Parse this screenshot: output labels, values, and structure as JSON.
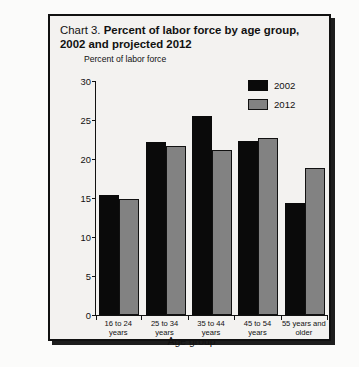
{
  "title": {
    "prefix": "Chart 3.",
    "line1": "Percent of labor force by age group,",
    "line2": "2002 and projected 2012"
  },
  "legend": {
    "items": [
      {
        "label": "2002",
        "color": "#0a0a0a"
      },
      {
        "label": "2012",
        "color": "#828282"
      }
    ]
  },
  "axis": {
    "y_title": "Percent of labor force",
    "x_title": "Age group",
    "y_ticks": [
      "0",
      "5",
      "10",
      "15",
      "20",
      "25",
      "30"
    ]
  },
  "categories": [
    {
      "line1": "16 to 24 years",
      "line2": ""
    },
    {
      "line1": "25 to 34 years",
      "line2": ""
    },
    {
      "line1": "35 to 44 years",
      "line2": ""
    },
    {
      "line1": "45 to 54 years",
      "line2": ""
    },
    {
      "line1": "55 years and",
      "line2": "older"
    }
  ],
  "chart_data": {
    "type": "bar",
    "title": "Chart 3. Percent of labor force by age group, 2002 and projected 2012",
    "xlabel": "Age group",
    "ylabel": "Percent of labor force",
    "ylim": [
      0,
      30
    ],
    "yticks": [
      0,
      5,
      10,
      15,
      20,
      25,
      30
    ],
    "grid": false,
    "legend_position": "top-right",
    "categories": [
      "16 to 24 years",
      "25 to 34 years",
      "35 to 44 years",
      "45 to 54 years",
      "55 years and older"
    ],
    "series": [
      {
        "name": "2002",
        "color": "#0a0a0a",
        "values": [
          15.4,
          22.2,
          25.5,
          22.3,
          14.3
        ]
      },
      {
        "name": "2012",
        "color": "#828282",
        "values": [
          14.9,
          21.7,
          21.1,
          22.7,
          18.8
        ]
      }
    ]
  }
}
